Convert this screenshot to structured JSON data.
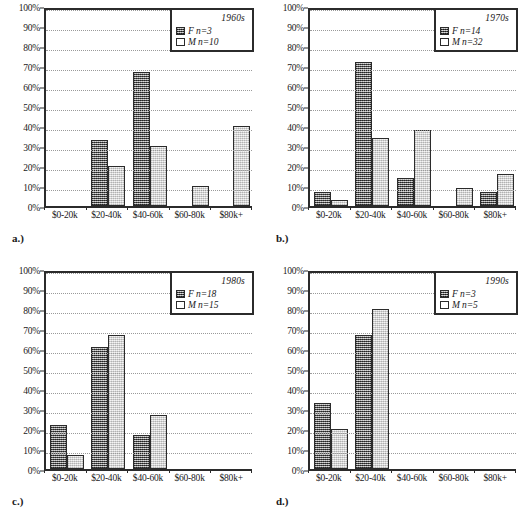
{
  "figure": {
    "axis": {
      "y_ticks": [
        "0%",
        "10%",
        "20%",
        "30%",
        "40%",
        "50%",
        "60%",
        "70%",
        "80%",
        "90%",
        "100%"
      ],
      "ylim": [
        0,
        100
      ],
      "categories": [
        "$0-20k",
        "$20-40k",
        "$40-60k",
        "$60-80k",
        "$80k+"
      ]
    },
    "panels": [
      {
        "key": "a",
        "caption": "a.)",
        "legend_title": "1960s",
        "legend_f": "F n=3",
        "legend_m": "M n=10"
      },
      {
        "key": "b",
        "caption": "b.)",
        "legend_title": "1970s",
        "legend_f": "F n=14",
        "legend_m": "M n=32"
      },
      {
        "key": "c",
        "caption": "c.)",
        "legend_title": "1980s",
        "legend_f": "F n=18",
        "legend_m": "M n=15"
      },
      {
        "key": "d",
        "caption": "d.)",
        "legend_title": "1990s",
        "legend_f": "F n=3",
        "legend_m": "M n=5"
      }
    ]
  },
  "chart_data": [
    {
      "type": "bar",
      "title": "1960s",
      "panel": "a.)",
      "xlabel": "",
      "ylabel": "",
      "ylim": [
        0,
        100
      ],
      "grid": true,
      "legend_position": "top-right",
      "categories": [
        "$0-20k",
        "$20-40k",
        "$40-60k",
        "$60-80k",
        "$80k+"
      ],
      "series": [
        {
          "name": "F n=3",
          "values": [
            0,
            33,
            67,
            0,
            0
          ]
        },
        {
          "name": "M n=10",
          "values": [
            0,
            20,
            30,
            10,
            40
          ]
        }
      ]
    },
    {
      "type": "bar",
      "title": "1970s",
      "panel": "b.)",
      "xlabel": "",
      "ylabel": "",
      "ylim": [
        0,
        100
      ],
      "grid": true,
      "legend_position": "top-right",
      "categories": [
        "$0-20k",
        "$20-40k",
        "$40-60k",
        "$60-80k",
        "$80k+"
      ],
      "series": [
        {
          "name": "F n=14",
          "values": [
            7,
            72,
            14,
            0,
            7
          ]
        },
        {
          "name": "M n=32",
          "values": [
            3,
            34,
            38,
            9,
            16
          ]
        }
      ]
    },
    {
      "type": "bar",
      "title": "1980s",
      "panel": "c.)",
      "xlabel": "",
      "ylabel": "",
      "ylim": [
        0,
        100
      ],
      "grid": true,
      "legend_position": "top-right",
      "categories": [
        "$0-20k",
        "$20-40k",
        "$40-60k",
        "$60-80k",
        "$80k+"
      ],
      "series": [
        {
          "name": "F n=18",
          "values": [
            22,
            61,
            17,
            0,
            0
          ]
        },
        {
          "name": "M n=15",
          "values": [
            7,
            67,
            27,
            0,
            0
          ]
        }
      ]
    },
    {
      "type": "bar",
      "title": "1990s",
      "panel": "d.)",
      "xlabel": "",
      "ylabel": "",
      "ylim": [
        0,
        100
      ],
      "grid": true,
      "legend_position": "top-right",
      "categories": [
        "$0-20k",
        "$20-40k",
        "$40-60k",
        "$60-80k",
        "$80k+"
      ],
      "series": [
        {
          "name": "F n=3",
          "values": [
            33,
            67,
            0,
            0,
            0
          ]
        },
        {
          "name": "M n=5",
          "values": [
            20,
            80,
            0,
            0,
            0
          ]
        }
      ]
    }
  ]
}
